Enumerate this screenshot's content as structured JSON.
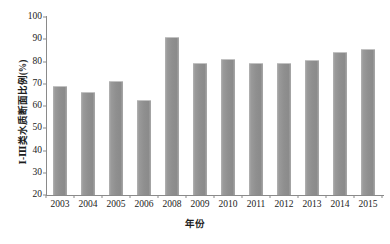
{
  "chart_data": {
    "type": "bar",
    "title": "",
    "subtitle": "",
    "xlabel": "年份",
    "ylabel": "Ⅰ-Ⅲ类水质断面比例(%)",
    "categories": [
      "2003",
      "2004",
      "2005",
      "2006",
      "2008",
      "2009",
      "2010",
      "2011",
      "2012",
      "2013",
      "2014",
      "2015"
    ],
    "values": [
      69.0,
      66.4,
      71.4,
      62.9,
      91.1,
      79.5,
      81.1,
      79.5,
      79.4,
      80.5,
      84.2,
      85.8
    ],
    "series": [
      {
        "name": "Ⅰ-Ⅲ类水质断面比例",
        "values": [
          69.0,
          66.4,
          71.4,
          62.9,
          91.1,
          79.5,
          81.1,
          79.5,
          79.4,
          80.5,
          84.2,
          85.8
        ]
      }
    ],
    "ylim": [
      20,
      100
    ],
    "ytick_values": [
      100,
      90,
      80,
      70,
      60,
      50,
      40,
      30,
      20
    ],
    "ytick_labels": [
      "100",
      "90",
      "80",
      "70",
      "60",
      "50",
      "40",
      "30",
      "20"
    ],
    "xtick_labels": [
      "2003",
      "2004",
      "2005",
      "2006",
      "2008",
      "2009",
      "2010",
      "2011",
      "2012",
      "2013",
      "2014",
      "2015"
    ],
    "grid": false,
    "legend": false,
    "legend_position": "none",
    "bar_color": "#909090",
    "axis_color": "#8a8a8a",
    "background_color": "#ffffff",
    "annotations": []
  }
}
